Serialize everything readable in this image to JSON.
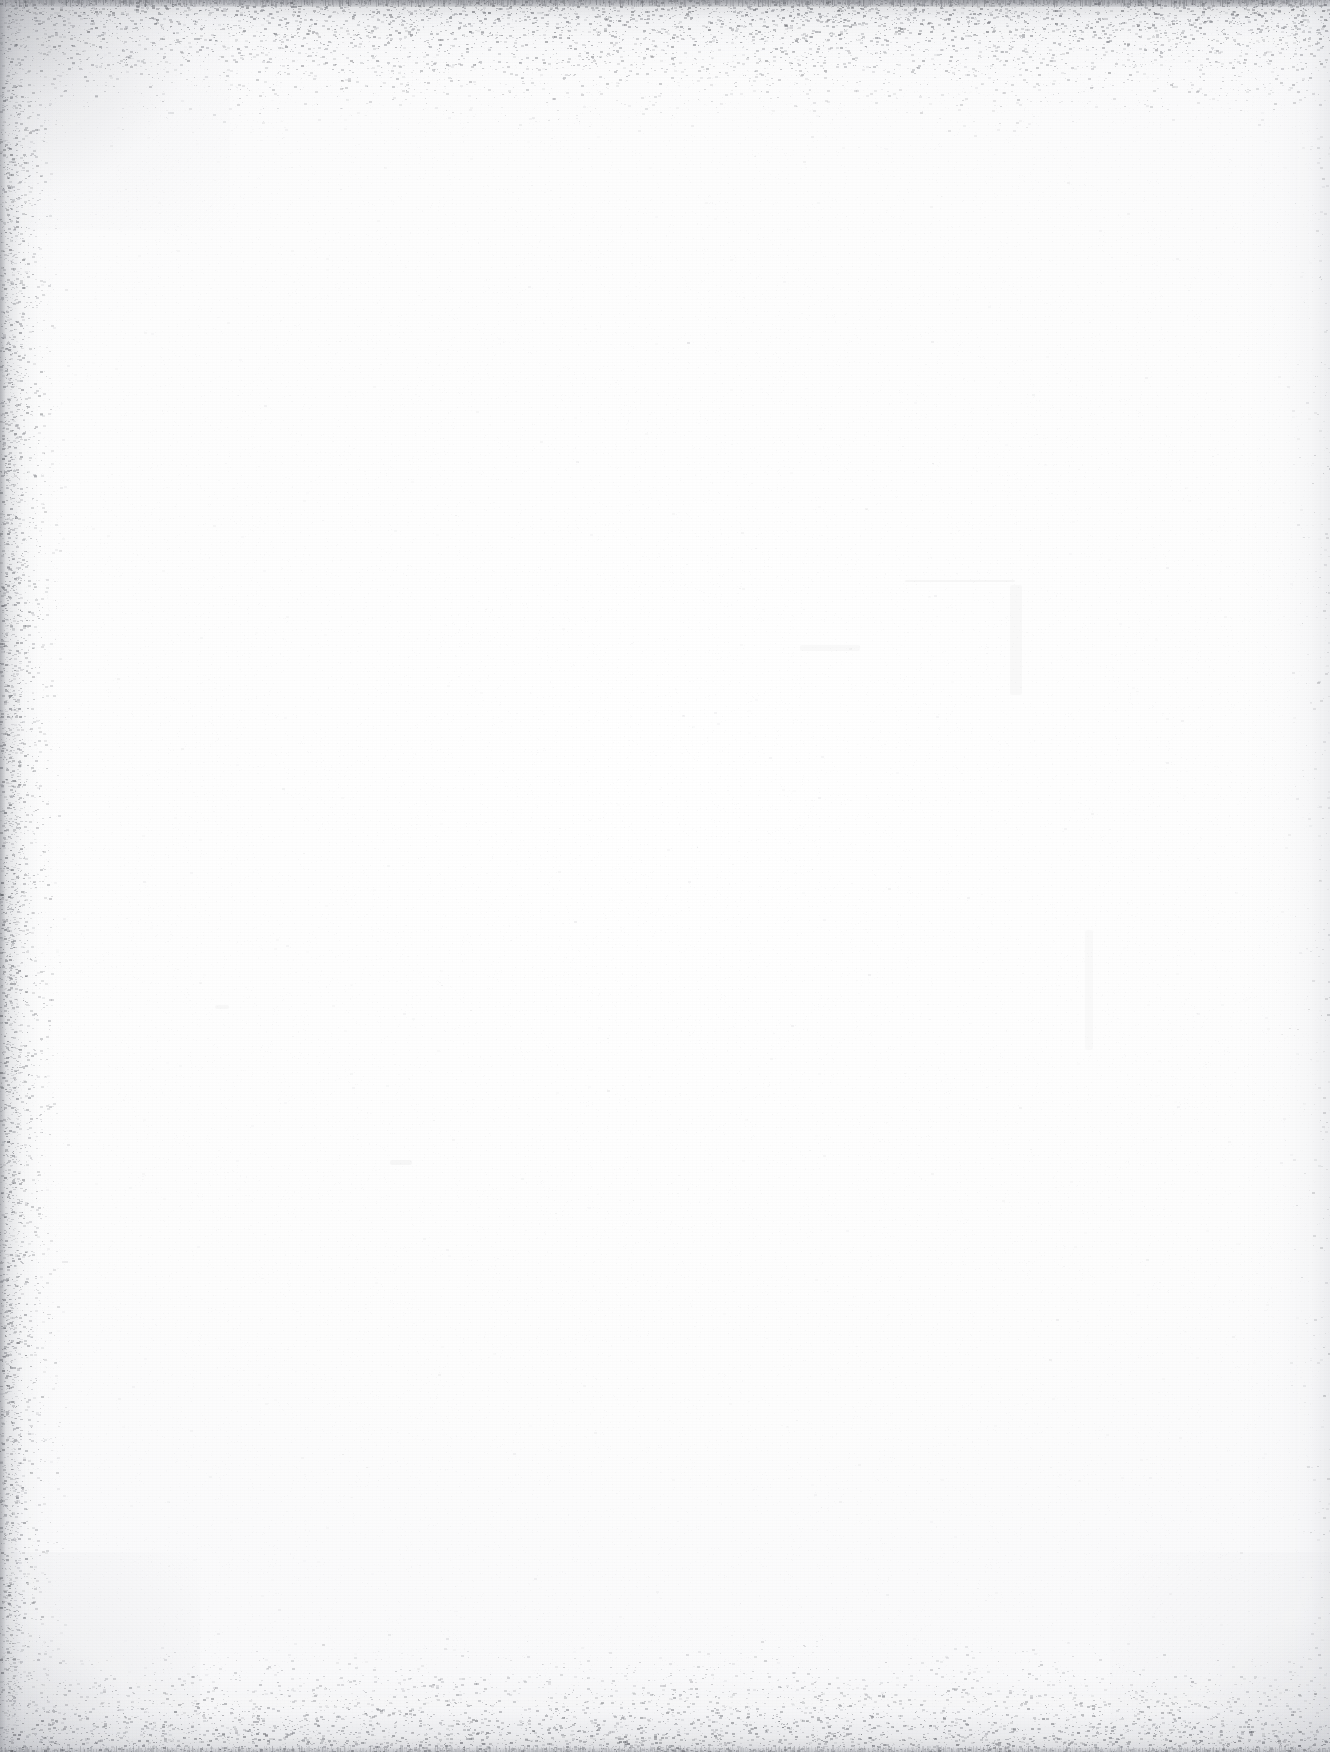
{
  "page": {
    "kind": "scanned-blank-page",
    "width": 1330,
    "height": 1752,
    "visible_text": "",
    "caption": "",
    "page_number": "",
    "background_color": "#ffffff",
    "paper_tone": "#fdfdfd"
  },
  "scan_artifacts": {
    "description": "Blank scanned page with speckled scanner-edge noise",
    "edges": [
      {
        "name": "top-edge-band",
        "position": "top",
        "thickness_px": 120,
        "color": "#aaacb2",
        "intensity": 0.55,
        "speckled": true
      },
      {
        "name": "left-edge-band",
        "position": "left",
        "thickness_px": 70,
        "color": "#a8aab0",
        "intensity": 0.5,
        "speckled": true
      },
      {
        "name": "right-edge-band",
        "position": "right",
        "thickness_px": 90,
        "color": "#d6d8dd",
        "intensity": 0.4,
        "speckled": false
      },
      {
        "name": "bottom-edge-band",
        "position": "bottom",
        "thickness_px": 130,
        "color": "#b2b4ba",
        "intensity": 0.46,
        "speckled": true
      }
    ],
    "corners": [
      {
        "name": "top-left-corner-shadow",
        "color": "#8c8e95",
        "intensity": 0.4
      },
      {
        "name": "bottom-left-corner-shadow",
        "color": "#a0a2a9",
        "intensity": 0.3
      },
      {
        "name": "bottom-right-corner-shadow",
        "color": "#afb1b8",
        "intensity": 0.26
      }
    ],
    "speckle": {
      "color": "#6e7076",
      "edge_density": 1.0,
      "field_density": 0.04,
      "min_size_px": 1,
      "max_size_px": 3,
      "seed": 20250131
    },
    "faint_marks": [
      {
        "name": "faint-bleed-line-1",
        "x": 905,
        "y": 580,
        "width": 110,
        "height": 2,
        "opacity": 0.05
      },
      {
        "name": "faint-bleed-line-2",
        "x": 1010,
        "y": 585,
        "width": 12,
        "height": 110,
        "opacity": 0.04
      },
      {
        "name": "faint-bleed-smudge-1",
        "x": 800,
        "y": 645,
        "width": 60,
        "height": 6,
        "opacity": 0.035
      },
      {
        "name": "faint-bleed-smudge-2",
        "x": 1085,
        "y": 930,
        "width": 8,
        "height": 120,
        "opacity": 0.03
      },
      {
        "name": "faint-speck-cluster-1",
        "x": 390,
        "y": 1160,
        "width": 22,
        "height": 5,
        "opacity": 0.05
      },
      {
        "name": "faint-speck-cluster-2",
        "x": 215,
        "y": 1005,
        "width": 14,
        "height": 4,
        "opacity": 0.045
      }
    ]
  }
}
